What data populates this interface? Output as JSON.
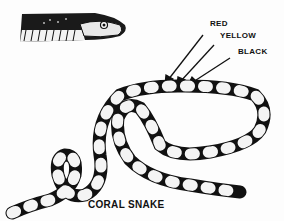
{
  "diagram": {
    "title": "CORAL SNAKE",
    "labels": [
      {
        "text": "RED"
      },
      {
        "text": "YELLOW"
      },
      {
        "text": "BLACK"
      }
    ],
    "colors": {
      "ink": "#111111",
      "background": "#fdfdfd"
    }
  }
}
